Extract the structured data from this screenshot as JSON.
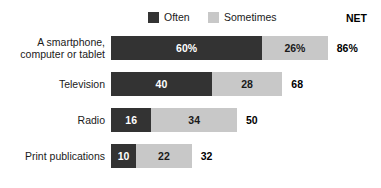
{
  "legend": {
    "entries": [
      {
        "label": "Often",
        "color": "#333333"
      },
      {
        "label": "Sometimes",
        "color": "#c8c8c8"
      }
    ],
    "net_header": "NET"
  },
  "chart_data": {
    "type": "bar",
    "orientation": "horizontal",
    "stacked": true,
    "title": "",
    "subtitle": "",
    "xlabel": "",
    "ylabel": "",
    "grid": false,
    "legend_position": "top-center",
    "xlim": [
      0,
      100
    ],
    "categories": [
      "A smartphone,\ncomputer or tablet",
      "Television",
      "Radio",
      "Print publications"
    ],
    "series": [
      {
        "name": "Often",
        "color": "#333333",
        "values": [
          60,
          40,
          16,
          10
        ]
      },
      {
        "name": "Sometimes",
        "color": "#c8c8c8",
        "values": [
          26,
          28,
          34,
          22
        ]
      }
    ],
    "net": {
      "label": "NET",
      "values": [
        86,
        68,
        50,
        32
      ]
    },
    "data_labels": [
      {
        "category": "A smartphone, computer or tablet",
        "often": "60%",
        "sometimes": "26%",
        "net": "86%"
      },
      {
        "category": "Television",
        "often": "40",
        "sometimes": "28",
        "net": "68"
      },
      {
        "category": "Radio",
        "often": "16",
        "sometimes": "34",
        "net": "50"
      },
      {
        "category": "Print publications",
        "often": "10",
        "sometimes": "22",
        "net": "32"
      }
    ]
  },
  "rows": [
    {
      "label": "A smartphone,\ncomputer or tablet",
      "often_text": "60%",
      "sometimes_text": "26%",
      "net_text": "86%"
    },
    {
      "label": "Television",
      "often_text": "40",
      "sometimes_text": "28",
      "net_text": "68"
    },
    {
      "label": "Radio",
      "often_text": "16",
      "sometimes_text": "34",
      "net_text": "50"
    },
    {
      "label": "Print publications",
      "often_text": "10",
      "sometimes_text": "22",
      "net_text": "32"
    }
  ]
}
